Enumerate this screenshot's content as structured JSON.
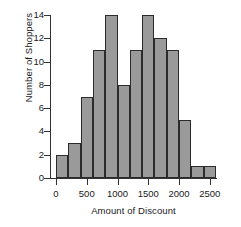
{
  "chart_data": {
    "type": "bar",
    "title": "",
    "xlabel": "Amount of Discount",
    "ylabel": "Number of Shoppers",
    "grid": false,
    "legend": "none",
    "bin_width": 200,
    "bin_edges": [
      0,
      200,
      400,
      600,
      800,
      1000,
      1200,
      1400,
      1600,
      1800,
      2000,
      2200,
      2400,
      2600
    ],
    "categories": [
      "0-200",
      "200-400",
      "400-600",
      "600-800",
      "800-1000",
      "1000-1200",
      "1200-1400",
      "1400-1600",
      "1600-1800",
      "1800-2000",
      "2000-2200",
      "2200-2400",
      "2400-2600"
    ],
    "values": [
      2,
      3,
      7,
      11,
      14,
      8,
      11,
      14,
      12,
      11,
      5,
      1,
      1
    ],
    "xlim": [
      0,
      2600
    ],
    "ylim": [
      0,
      14
    ],
    "xticks": [
      0,
      500,
      1000,
      1500,
      2000,
      2500
    ],
    "xtick_labels": [
      "0",
      "500",
      "1000",
      "1500",
      "2000",
      "2500"
    ],
    "yticks": [
      0,
      2,
      4,
      6,
      8,
      10,
      12,
      14
    ],
    "ytick_labels": [
      "0",
      "2",
      "4",
      "6",
      "8",
      "10",
      "12",
      "14"
    ],
    "bar_fill_color": "#9a9a9a",
    "bar_edge_color": "#2b2b2b",
    "axis_color": "#333333",
    "background_color": "#ffffff"
  }
}
